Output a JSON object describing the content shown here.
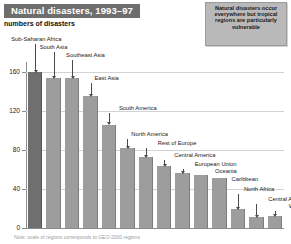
{
  "header": {
    "title": "Natural disasters, 1993–97",
    "subtitle": "numbers of disasters"
  },
  "callout": {
    "text": "Natural disasters occur everywhere but tropical regions are particularly vulnerable"
  },
  "footnote": "Note: scale of regions corresponds to GEO-2000 regions",
  "colors": {
    "title_bar": "#6e6e6e",
    "bar": "#9d9d9d",
    "bar_highlight": "#6f6f6f",
    "callout_bg": "#b9b9b9",
    "grid": "#d2d2d2",
    "axis": "#8c8c8c"
  },
  "chart_data": {
    "type": "bar",
    "title": "Natural disasters, 1993–97",
    "subtitle": "numbers of disasters",
    "xlabel": "",
    "ylabel": "numbers of disasters",
    "ylim": [
      0,
      170
    ],
    "yticks": [
      0,
      40,
      80,
      120,
      160
    ],
    "grid": true,
    "legend": "none",
    "categories": [
      "Sub-Saharan Africa",
      "South Asia",
      "Southeast Asia",
      "East Asia",
      "South America",
      "North America",
      "Rest of Europe",
      "Central America",
      "European Union",
      "Oceania",
      "Caribbean",
      "North Africa",
      "Central Asia",
      "West Asia"
    ],
    "values": [
      160,
      154,
      154,
      135,
      106,
      82,
      73,
      63,
      56,
      54,
      51,
      19,
      11,
      12
    ],
    "annotations": [
      "Natural disasters occur everywhere but tropical regions are particularly vulnerable"
    ]
  }
}
